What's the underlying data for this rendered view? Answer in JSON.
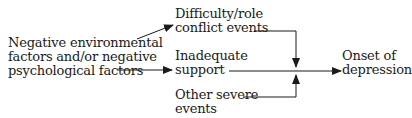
{
  "diagram": {
    "type": "flow",
    "nodes": {
      "cause": {
        "line1": "Negative environmental",
        "line2": "factors and/or negative",
        "line3": "psychological factors"
      },
      "difficulty": {
        "line1": "Difficulty/role",
        "line2": "conflict events"
      },
      "support": {
        "line1": "Inadequate",
        "line2": "support"
      },
      "severe": {
        "line1": "Other severe",
        "line2": "events"
      },
      "outcome": {
        "line1": "Onset of",
        "line2": "depression"
      }
    },
    "edges": [
      {
        "from": "cause",
        "to": "difficulty"
      },
      {
        "from": "cause",
        "to": "support"
      },
      {
        "from": "difficulty",
        "to": "outcome"
      },
      {
        "from": "support",
        "to": "outcome"
      },
      {
        "from": "severe",
        "to": "outcome"
      }
    ],
    "colors": {
      "line": "#1a1a1a",
      "background": "#ffffff"
    }
  }
}
